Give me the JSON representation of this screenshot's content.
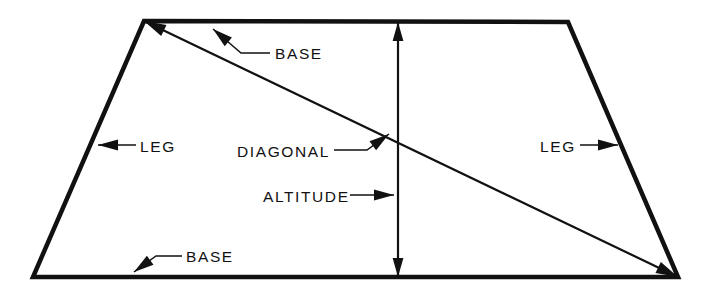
{
  "figure": {
    "background_color": "#ffffff",
    "line_color": "#111111",
    "width": 712,
    "height": 295
  },
  "shape": {
    "name": "trapezoid",
    "vertices": {
      "top_left": [
        144,
        21
      ],
      "top_right": [
        568,
        22
      ],
      "bottom_right": [
        678,
        277
      ],
      "bottom_left": [
        33,
        277
      ]
    },
    "outline_stroke_width": 4.5
  },
  "diagonal": {
    "from": [
      144,
      21
    ],
    "to": [
      678,
      277
    ],
    "stroke_width": 2.2,
    "arrow_ends": "both"
  },
  "altitude": {
    "x": 398,
    "from_y": 22,
    "to_y": 277,
    "stroke_width": 2.2,
    "arrow_ends": "both"
  },
  "labels": [
    {
      "id": "base-top",
      "text": "BASE",
      "text_x": 275,
      "text_y": 59,
      "leader": [
        [
          270,
          53
        ],
        [
          241,
          53
        ],
        [
          213,
          29
        ]
      ],
      "arrow_at": [
        213,
        29
      ],
      "arrow_angle": -140
    },
    {
      "id": "base-bottom",
      "text": "BASE",
      "text_x": 186,
      "text_y": 262,
      "leader": [
        [
          182,
          256
        ],
        [
          156,
          256
        ],
        [
          134,
          272
        ]
      ],
      "arrow_at": [
        134,
        272
      ],
      "arrow_angle": 144
    },
    {
      "id": "leg-left",
      "text": "LEG",
      "text_x": 140,
      "text_y": 152,
      "leader": [
        [
          136,
          145
        ],
        [
          98,
          145
        ]
      ],
      "arrow_at": [
        98,
        145
      ],
      "arrow_angle": 180
    },
    {
      "id": "leg-right",
      "text": "LEG",
      "text_x": 540,
      "text_y": 152,
      "leader": [
        [
          580,
          145
        ],
        [
          618,
          145
        ]
      ],
      "arrow_at": [
        618,
        145
      ],
      "arrow_angle": 0
    },
    {
      "id": "diagonal",
      "text": "DIAGONAL",
      "text_x": 237,
      "text_y": 157,
      "leader": [
        [
          334,
          150
        ],
        [
          367,
          150
        ],
        [
          389,
          134
        ]
      ],
      "arrow_at": [
        389,
        134
      ],
      "arrow_angle": -36
    },
    {
      "id": "altitude",
      "text": "ALTITUDE",
      "text_x": 263,
      "text_y": 202,
      "leader": [
        [
          350,
          195
        ],
        [
          394,
          195
        ]
      ],
      "arrow_at": [
        394,
        195
      ],
      "arrow_angle": 0
    }
  ]
}
